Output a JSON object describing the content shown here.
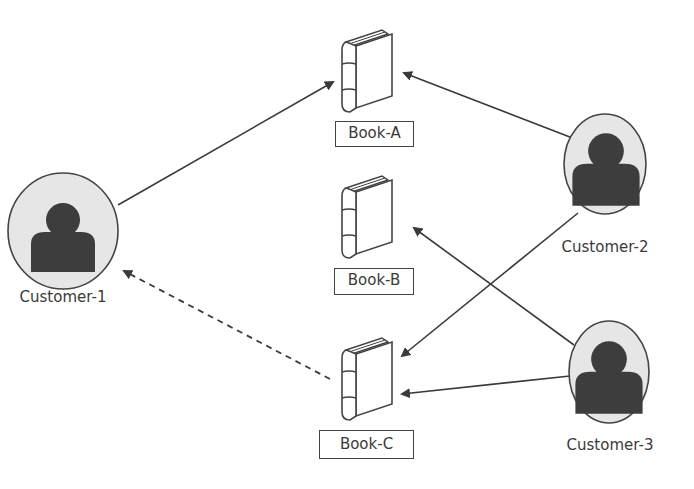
{
  "diagram": {
    "type": "bipartite-recommendation-graph",
    "colors": {
      "line": "#3a3a3a",
      "person_fill": "#3d3d3d",
      "circle_fill": "#e6e6e6",
      "circle_stroke": "#444444"
    },
    "customers": [
      {
        "id": "c1",
        "label": "Customer-1"
      },
      {
        "id": "c2",
        "label": "Customer-2"
      },
      {
        "id": "c3",
        "label": "Customer-3"
      }
    ],
    "books": [
      {
        "id": "a",
        "label": "Book-A"
      },
      {
        "id": "b",
        "label": "Book-B"
      },
      {
        "id": "c",
        "label": "Book-C"
      }
    ],
    "edges": [
      {
        "from": "Customer-1",
        "to": "Book-A",
        "style": "solid"
      },
      {
        "from": "Customer-2",
        "to": "Book-A",
        "style": "solid"
      },
      {
        "from": "Customer-2",
        "to": "Book-C",
        "style": "solid"
      },
      {
        "from": "Customer-3",
        "to": "Book-B",
        "style": "solid"
      },
      {
        "from": "Customer-3",
        "to": "Book-C",
        "style": "solid"
      },
      {
        "from": "Book-C",
        "to": "Customer-1",
        "style": "dashed",
        "meaning": "recommendation"
      }
    ]
  }
}
